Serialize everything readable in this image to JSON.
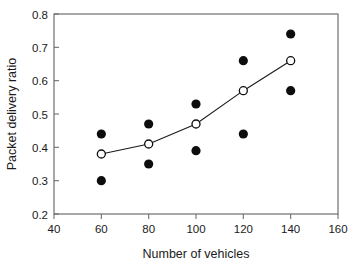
{
  "chart_data": {
    "type": "scatter",
    "title": "",
    "xlabel": "Number of vehicles",
    "ylabel": "Packet delivery ratio",
    "xlim": [
      40,
      160
    ],
    "ylim": [
      0.2,
      0.8
    ],
    "xticks": [
      40,
      60,
      80,
      100,
      120,
      140,
      160
    ],
    "xtick_labels": [
      "40",
      "60",
      "80",
      "100",
      "120",
      "140",
      "160"
    ],
    "yticks": [
      0.2,
      0.3,
      0.4,
      0.5,
      0.6,
      0.7,
      0.8
    ],
    "ytick_labels": [
      "0.2",
      "0.3",
      "0.4",
      "0.5",
      "0.6",
      "0.7",
      "0.8"
    ],
    "grid": false,
    "legend": "none",
    "frame": "box",
    "x": [
      60,
      80,
      100,
      120,
      140
    ],
    "series": [
      {
        "name": "open-circle-line",
        "marker": "open-circle",
        "line": true,
        "color": "#0d0d0d",
        "values": [
          0.38,
          0.41,
          0.47,
          0.57,
          0.66
        ]
      },
      {
        "name": "filled-upper",
        "marker": "filled-circle",
        "line": false,
        "color": "#0d0d0d",
        "values": [
          0.44,
          0.47,
          0.53,
          0.66,
          0.74
        ]
      },
      {
        "name": "filled-lower",
        "marker": "filled-circle",
        "line": false,
        "color": "#0d0d0d",
        "values": [
          0.3,
          0.35,
          0.39,
          0.44,
          0.57
        ]
      }
    ]
  },
  "axis": {
    "x_title": "Number of vehicles",
    "y_title": "Packet delivery ratio",
    "x_labels": [
      "40",
      "60",
      "80",
      "100",
      "120",
      "140",
      "160"
    ],
    "y_labels": [
      "0.8",
      "0.7",
      "0.6",
      "0.5",
      "0.4",
      "0.3",
      "0.2"
    ]
  },
  "colors": {
    "marker": "#0d0d0d",
    "frame": "#6f6f6f",
    "text": "#1a1a1a",
    "background": "#ffffff"
  }
}
